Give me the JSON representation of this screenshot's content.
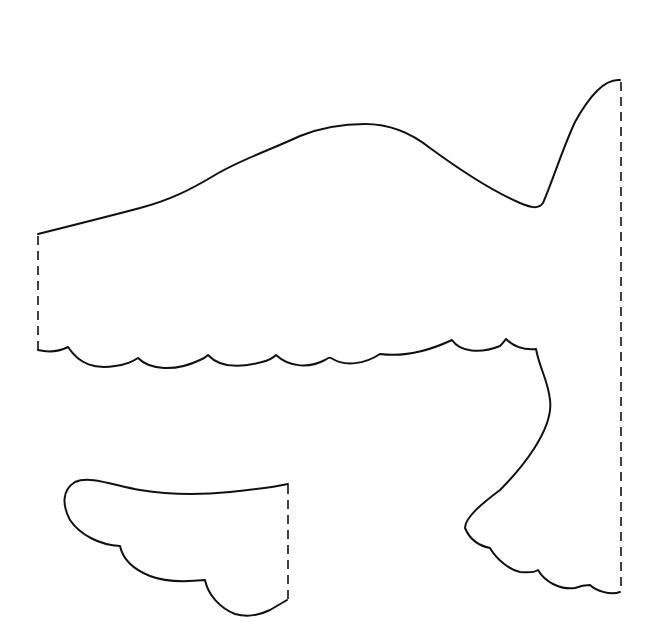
{
  "page": {
    "background": "#ffffff",
    "line_color": "#111111"
  },
  "pieces": [
    {
      "name": "body",
      "cut_line": "solid",
      "fold_lines": [
        "left edge",
        "right edge"
      ]
    },
    {
      "name": "wing",
      "cut_line": "solid",
      "fold_lines": [
        "right edge"
      ]
    }
  ]
}
